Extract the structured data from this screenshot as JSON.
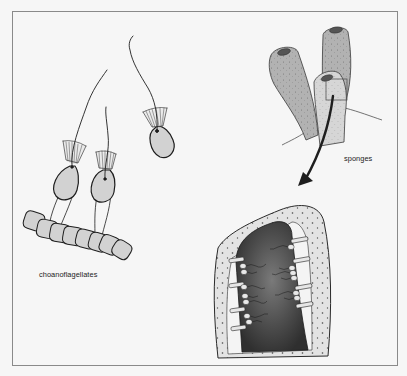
{
  "figure": {
    "labels": {
      "choanoflagellates": "choanoflagellates",
      "sponges": "sponges"
    },
    "colors": {
      "background": "#f6f6f6",
      "frame": "#8a8a8a",
      "cell_fill": "#d2d2d2",
      "sponge_dark": "#b4b4b4",
      "sponge_light": "#d8d8d8",
      "section_wall": "#e2e2e2",
      "section_cavity": "#4a4a4a",
      "outline": "#1e1e1e"
    },
    "elements": [
      "choanoflagellate-colony",
      "free-choanoflagellate",
      "sponge-cluster",
      "magnify-box",
      "pointer-arrow",
      "sponge-cross-section"
    ]
  }
}
